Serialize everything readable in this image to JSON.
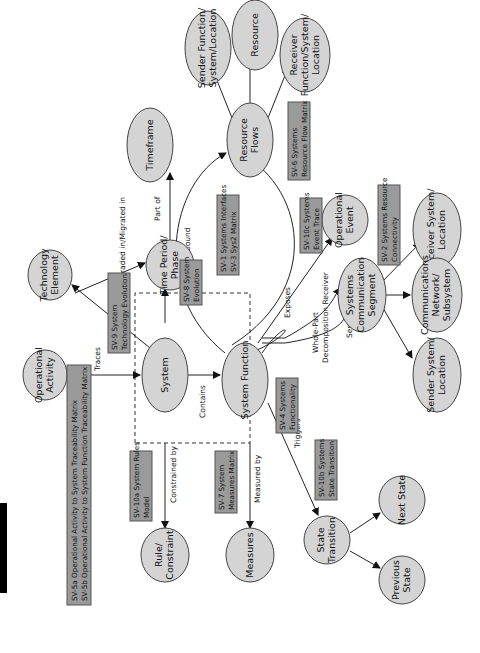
{
  "diagram": {
    "title_block_color": "#000000",
    "node_fill": "#d4d4d4",
    "box_fill": "#9a9a9a",
    "nodes": {
      "operational_activity": [
        "Operational",
        "Activity"
      ],
      "technology_element": [
        "Technology",
        "Element"
      ],
      "system": [
        "System"
      ],
      "system_function": [
        "System Function"
      ],
      "time_period_phase": [
        "Time Period/",
        "Phase"
      ],
      "timeframe": [
        "Timeframe"
      ],
      "resource_flows": [
        "Resource",
        "Flows"
      ],
      "sender_function": [
        "Sender Function/",
        "System/Location"
      ],
      "resource": [
        "Resource"
      ],
      "receiver_function": [
        "Receiver",
        "Function/System/",
        "Location"
      ],
      "operational_event": [
        "Operational",
        "Event"
      ],
      "systems_comm_segment": [
        "Systems",
        "Communication",
        "Segment"
      ],
      "receiver_system_location": [
        "Receiver System/",
        "Location"
      ],
      "communications_network": [
        "Communications",
        "Network/",
        "Subsystem"
      ],
      "sender_system_location": [
        "Sender System/",
        "Location"
      ],
      "rule_constraint": [
        "Rule/",
        "Constraint"
      ],
      "measures": [
        "Measures"
      ],
      "state_transition": [
        "State",
        "Transition"
      ],
      "next_state": [
        "Next State"
      ],
      "previous_state": [
        "Previous",
        "State"
      ]
    },
    "view_boxes": {
      "sv5": [
        "SV-5a Operational Activity to System Traceability Matrix",
        "SV-5b Operational Activity to System Function Traceability Matrix"
      ],
      "sv9": [
        "SV-9 System",
        "Technology Evolution"
      ],
      "sv8": [
        "SV-8 System",
        "Evolution"
      ],
      "sv1": [
        "SV-1 Systems Interfaces",
        "SV-3 Sys2 Matrix"
      ],
      "sv6": [
        "SV-6 Systems",
        "Resource Flow Matrix"
      ],
      "sv10c": [
        "SV-10c Systems",
        "Event Trace"
      ],
      "sv2": [
        "SV-2 Systems Resource",
        "Connectivity"
      ],
      "sv4": [
        "SV-4 Systems",
        "Functionality"
      ],
      "sv10a": [
        "SV-10a System Rules",
        "Model"
      ],
      "sv7": [
        "SV-7 System",
        "Measures Matrix"
      ],
      "sv10b": [
        "SV-10b Systems",
        "State Transition"
      ]
    },
    "edge_labels": {
      "traces": "Traces",
      "upgraded": "Upgraded in/Migrated in",
      "part_of": "Part of",
      "contains": "Contains",
      "inbound": "Inbound",
      "outbound": "Outbound",
      "exposes": "Exposes",
      "whole_part": "Whole-Part",
      "decomposition_receiver": "Decomposition Receiver",
      "sender": "Sender",
      "constrained_by": "Constrained by",
      "measured_by": "Measured by",
      "triggers": "Triggers"
    }
  }
}
